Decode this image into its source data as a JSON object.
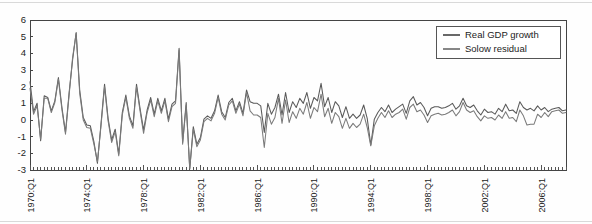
{
  "chart_data": {
    "type": "line",
    "title": "",
    "xlabel": "",
    "ylabel": "",
    "ylim": [
      -3,
      6
    ],
    "yticks": [
      -3,
      -2,
      -1,
      0,
      1,
      2,
      3,
      4,
      5,
      6
    ],
    "ytick_labels": [
      "-3",
      "-2",
      "-1",
      "0",
      "1",
      "2",
      "3",
      "4",
      "5",
      "6"
    ],
    "xtick_labels": [
      "1970:Q1",
      "1974:Q1",
      "1978:Q1",
      "1982:Q1",
      "1986:Q1",
      "1990:Q1",
      "1994:Q1",
      "1998:Q1",
      "2002:Q1",
      "2006:Q1"
    ],
    "xtick_indices": [
      0,
      16,
      32,
      48,
      64,
      80,
      96,
      112,
      128,
      144
    ],
    "x_start_label": "1970:Q1",
    "x_end_label": "2007:Q4",
    "n_points": 152,
    "frequency": "quarterly",
    "grid": false,
    "legend_position": "top-right",
    "legend": [
      "Real GDP growth",
      "Solow residual"
    ],
    "colors": {
      "real_gdp_growth": "#595959",
      "solow_residual": "#7a7a7a",
      "axis": "#444444",
      "background": "#ffffff",
      "frame": "#d9d9d9"
    },
    "series": [
      {
        "name": "Real GDP growth",
        "color": "#595959",
        "values": [
          2.3,
          0.5,
          1.0,
          -1.25,
          1.45,
          1.35,
          0.55,
          1.15,
          2.55,
          0.75,
          -0.75,
          1.6,
          3.6,
          5.25,
          1.8,
          0.15,
          -0.3,
          -0.35,
          -1.3,
          -2.6,
          -0.25,
          2.15,
          0.1,
          -1.2,
          -0.55,
          -2.05,
          0.45,
          1.5,
          0.25,
          -0.35,
          2.15,
          0.7,
          -0.6,
          0.6,
          1.35,
          0.35,
          1.3,
          0.55,
          1.3,
          0.05,
          0.95,
          1.15,
          4.3,
          -1.35,
          1.05,
          -2.95,
          -0.4,
          -1.45,
          -1.05,
          0.05,
          0.25,
          0.1,
          0.55,
          1.5,
          0.5,
          0.15,
          1.05,
          1.3,
          0.55,
          1.1,
          0.4,
          1.8,
          1.1,
          1.0,
          1.0,
          0.85,
          -0.75,
          1.0,
          0.35,
          0.75,
          1.55,
          0.3,
          1.65,
          0.45,
          1.1,
          0.75,
          1.3,
          1.0,
          1.65,
          0.7,
          1.35,
          1.15,
          2.2,
          0.8,
          1.35,
          0.45,
          1.1,
          0.85,
          0.15,
          0.8,
          0.1,
          0.35,
          0.1,
          0.3,
          0.9,
          0.1,
          -1.5,
          0.05,
          0.45,
          0.75,
          0.5,
          0.9,
          0.45,
          0.65,
          0.8,
          0.95,
          0.4,
          1.15,
          1.4,
          0.9,
          1.05,
          0.75,
          0.25,
          0.7,
          0.8,
          0.8,
          0.7,
          0.75,
          0.85,
          1.0,
          0.65,
          0.85,
          1.3,
          0.85,
          0.75,
          0.9,
          0.55,
          0.3,
          0.65,
          0.45,
          0.5,
          0.35,
          0.7,
          0.5,
          0.95,
          0.55,
          0.6,
          0.4,
          1.1,
          0.75,
          0.6,
          0.7,
          0.55,
          0.85,
          0.6,
          0.75,
          0.5,
          0.65,
          0.7,
          0.75,
          0.55,
          0.6
        ]
      },
      {
        "name": "Solow residual",
        "color": "#7a7a7a",
        "values": [
          1.9,
          0.35,
          0.85,
          -1.15,
          1.3,
          1.3,
          0.45,
          1.05,
          2.45,
          0.6,
          -0.85,
          1.45,
          3.75,
          5.2,
          1.6,
          0.0,
          -0.45,
          -0.5,
          -1.45,
          -2.5,
          -0.35,
          2.0,
          -0.05,
          -1.35,
          -0.7,
          -2.15,
          0.3,
          1.35,
          0.1,
          -0.5,
          2.0,
          0.55,
          -0.8,
          0.45,
          1.2,
          0.2,
          1.15,
          0.4,
          1.15,
          -0.1,
          0.8,
          1.0,
          4.2,
          -1.45,
          0.9,
          -2.9,
          -0.55,
          -1.6,
          -1.2,
          -0.1,
          0.1,
          -0.05,
          0.4,
          1.35,
          0.35,
          0.0,
          0.9,
          1.15,
          0.4,
          0.95,
          0.25,
          1.65,
          0.55,
          0.3,
          0.3,
          0.15,
          -1.65,
          0.4,
          -0.25,
          0.15,
          1.3,
          -0.2,
          1.2,
          -0.15,
          0.5,
          0.1,
          0.7,
          0.35,
          1.05,
          0.1,
          0.75,
          0.5,
          1.55,
          0.2,
          0.7,
          -0.2,
          0.45,
          0.2,
          -0.5,
          0.1,
          -0.5,
          -0.2,
          -0.45,
          -0.25,
          0.35,
          -0.45,
          -1.55,
          -0.35,
          0.1,
          0.45,
          0.15,
          0.55,
          0.15,
          0.35,
          0.45,
          0.65,
          0.05,
          0.75,
          0.95,
          0.5,
          0.6,
          0.3,
          -0.15,
          0.25,
          0.35,
          0.4,
          0.3,
          0.35,
          0.45,
          0.6,
          0.25,
          0.5,
          1.05,
          0.6,
          0.45,
          0.55,
          0.2,
          -0.05,
          0.25,
          0.1,
          0.15,
          0.0,
          0.3,
          0.1,
          0.5,
          0.1,
          0.15,
          -0.1,
          0.6,
          0.25,
          -0.3,
          -0.25,
          -0.25,
          0.35,
          0.15,
          0.45,
          0.2,
          0.5,
          0.55,
          0.6,
          0.4,
          0.45
        ]
      }
    ]
  }
}
